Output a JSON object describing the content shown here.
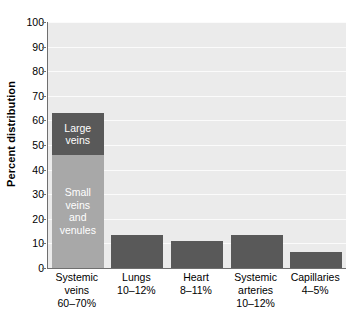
{
  "chart_data": {
    "type": "bar",
    "title": "",
    "xlabel": "",
    "ylabel": "Percent distribution",
    "ylim": [
      0,
      100
    ],
    "yticks": [
      0,
      10,
      20,
      30,
      40,
      50,
      60,
      70,
      80,
      90,
      100
    ],
    "ytick_labels": [
      "0",
      "10",
      "20",
      "30",
      "40",
      "50",
      "60",
      "70",
      "80",
      "90",
      "100"
    ],
    "grid": true,
    "legend": "none",
    "stacked_first_bar": true,
    "categories": [
      "Systemic\nveins\n60–70%",
      "Lungs\n10–12%",
      "Heart\n8–11%",
      "Systemic\narteries\n10–12%",
      "Capillaries\n4–5%"
    ],
    "category_names": [
      "Systemic veins",
      "Lungs",
      "Heart",
      "Systemic arteries",
      "Capillaries"
    ],
    "category_ranges": [
      "60–70%",
      "10–12%",
      "8–11%",
      "10–12%",
      "4–5%"
    ],
    "values": [
      63,
      13.5,
      11,
      13.5,
      6.5
    ],
    "bars": [
      {
        "name": "Systemic veins",
        "total": 63,
        "segments": [
          {
            "label": "Large\nveins",
            "value": 17,
            "color": "#595959"
          },
          {
            "label": "Small\nveins\nand\nvenules",
            "value": 46,
            "color": "#a8a8a8"
          }
        ]
      },
      {
        "name": "Lungs",
        "total": 13.5,
        "segments": [
          {
            "label": "",
            "value": 13.5,
            "color": "#595959"
          }
        ]
      },
      {
        "name": "Heart",
        "total": 11,
        "segments": [
          {
            "label": "",
            "value": 11,
            "color": "#595959"
          }
        ]
      },
      {
        "name": "Systemic arteries",
        "total": 13.5,
        "segments": [
          {
            "label": "",
            "value": 13.5,
            "color": "#595959"
          }
        ]
      },
      {
        "name": "Capillaries",
        "total": 6.5,
        "segments": [
          {
            "label": "",
            "value": 6.5,
            "color": "#595959"
          }
        ]
      }
    ],
    "colors": {
      "bar_dark": "#595959",
      "bar_light": "#a8a8a8",
      "plot_background": "#ebebeb",
      "gridline": "#fbfbfb",
      "axis": "#6f6f6f",
      "text": "#000000",
      "bar_label_text": "#ffffff"
    }
  }
}
